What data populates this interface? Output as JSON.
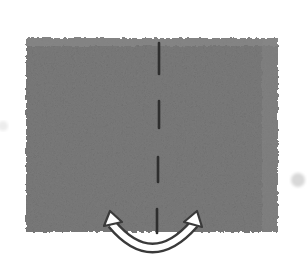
{
  "diagram": {
    "type": "origami-fold-step",
    "paper": {
      "shape": "square",
      "color": "#7b7b7b",
      "texture": "grainy",
      "x": 26,
      "y": 38,
      "width": 252,
      "height": 194
    },
    "fold_line": {
      "style": "dashed",
      "orientation": "vertical",
      "x": 157,
      "color": "#2e2e2e",
      "dashes": [
        [
          42,
          74
        ],
        [
          100,
          128
        ],
        [
          156,
          182
        ],
        [
          208,
          233
        ]
      ]
    },
    "arrow": {
      "type": "curved-double-headed",
      "color": "#3a3a3a",
      "fill": "#ffffff",
      "start": [
        110,
        214
      ],
      "bottom": [
        152,
        250
      ],
      "end": [
        196,
        214
      ]
    },
    "marks": [
      {
        "name": "registration-dot-right",
        "cx": 298,
        "cy": 180,
        "r": 7,
        "color": "#d8d8d8"
      },
      {
        "name": "smudge-left",
        "cx": 3,
        "cy": 126,
        "r": 5,
        "color": "#ececec"
      }
    ]
  }
}
